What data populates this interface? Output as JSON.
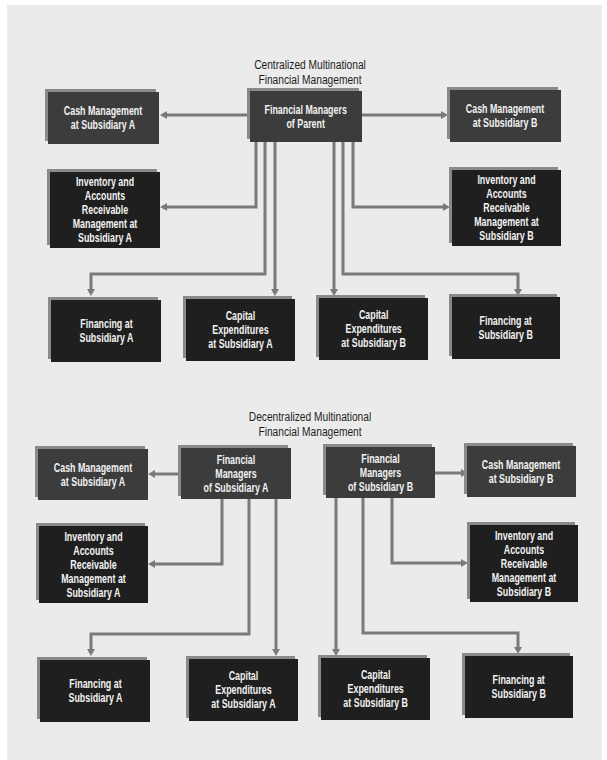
{
  "colors": {
    "panel_background": "#ebebeb",
    "box_medium": "#3c3c3c",
    "box_dark": "#1f1f1f",
    "box_shadow": "#8a8a8a",
    "connector": "#7a7a7a",
    "box_text": "#f2f2f2",
    "title_text": "#1e1e1e"
  },
  "centralized": {
    "title_line1": "Centralized Multinational",
    "title_line2": "Financial Management",
    "parent": {
      "line1": "Financial Managers",
      "line2": "of Parent"
    },
    "cash_a": {
      "line1": "Cash Management",
      "line2": "at Subsidiary A"
    },
    "cash_b": {
      "line1": "Cash Management",
      "line2": "at Subsidiary B"
    },
    "inventory_a": {
      "line1": "Inventory and",
      "line2": "Accounts Receivable",
      "line3": "Management at",
      "line4": "Subsidiary A"
    },
    "inventory_b": {
      "line1": "Inventory and",
      "line2": "Accounts Receivable",
      "line3": "Management at",
      "line4": "Subsidiary B"
    },
    "financing_a": {
      "line1": "Financing at",
      "line2": "Subsidiary A"
    },
    "capex_a": {
      "line1": "Capital",
      "line2": "Expenditures",
      "line3": "at Subsidiary A"
    },
    "capex_b": {
      "line1": "Capital",
      "line2": "Expenditures",
      "line3": "at Subsidiary B"
    },
    "financing_b": {
      "line1": "Financing at",
      "line2": "Subsidiary B"
    }
  },
  "decentralized": {
    "title_line1": "Decentralized Multinational",
    "title_line2": "Financial Management",
    "manager_a": {
      "line1": "Financial Managers",
      "line2": "of Subsidiary A"
    },
    "manager_b": {
      "line1": "Financial Managers",
      "line2": "of Subsidiary B"
    },
    "cash_a": {
      "line1": "Cash Management",
      "line2": "at Subsidiary A"
    },
    "cash_b": {
      "line1": "Cash Management",
      "line2": "at Subsidiary B"
    },
    "inventory_a": {
      "line1": "Inventory and",
      "line2": "Accounts Receivable",
      "line3": "Management at",
      "line4": "Subsidiary A"
    },
    "inventory_b": {
      "line1": "Inventory and",
      "line2": "Accounts Receivable",
      "line3": "Management at",
      "line4": "Subsidiary B"
    },
    "financing_a": {
      "line1": "Financing at",
      "line2": "Subsidiary A"
    },
    "capex_a": {
      "line1": "Capital",
      "line2": "Expenditures",
      "line3": "at Subsidiary A"
    },
    "capex_b": {
      "line1": "Capital",
      "line2": "Expenditures",
      "line3": "at Subsidiary B"
    },
    "financing_b": {
      "line1": "Financing at",
      "line2": "Subsidiary B"
    }
  }
}
